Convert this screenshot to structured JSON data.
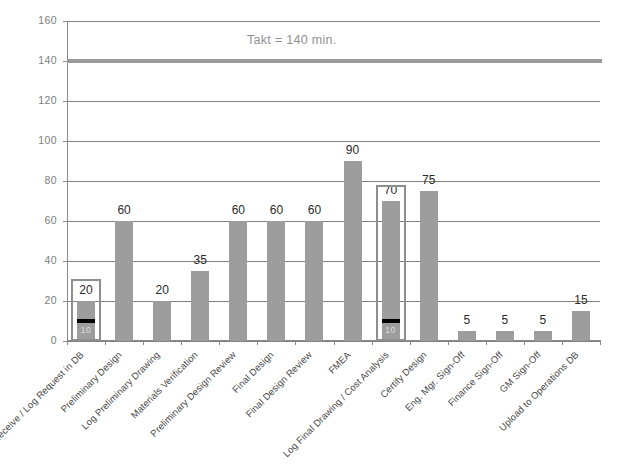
{
  "chart_data": {
    "type": "bar",
    "title": "",
    "subtitle": "",
    "xlabel": "",
    "ylabel": "",
    "ylim": [
      0,
      160
    ],
    "ytick_labels": [
      "0",
      "20",
      "40",
      "60",
      "80",
      "100",
      "120",
      "140",
      "160"
    ],
    "ytick_values": [
      0,
      20,
      40,
      60,
      80,
      100,
      120,
      140,
      160
    ],
    "grid": true,
    "legend": "none",
    "categories": [
      "Receive / Log Request in DB",
      "Preliminary Design",
      "Log Preliminary Drawing",
      "Materials Verification",
      "Preliminary Design Review",
      "Final Design",
      "Final Design Review",
      "FMEA",
      "Log Final Drawing / Cost Analysis",
      "Certify Design",
      "Eng. Mgr. Sign-Off",
      "Finance Sign-Off",
      "GM Sign-Off",
      "Upload to Operations DB"
    ],
    "values": [
      20,
      60,
      20,
      35,
      60,
      60,
      60,
      90,
      70,
      75,
      5,
      5,
      5,
      15
    ],
    "value_labels": [
      "20",
      "60",
      "20",
      "35",
      "60",
      "60",
      "60",
      "90",
      "70",
      "75",
      "5",
      "5",
      "5",
      "15"
    ],
    "annotations": [
      {
        "name": "takt-line",
        "label": "Takt = 140 min.",
        "value": 140
      },
      {
        "name": "highlight-callout-1",
        "category_index": 0,
        "box_top_value": 31,
        "marker_value": 10,
        "marker_label": "10"
      },
      {
        "name": "highlight-callout-2",
        "category_index": 8,
        "box_top_value": 78,
        "marker_value": 10,
        "marker_label": "10"
      }
    ],
    "colors": {
      "bar": "#9d9d9d",
      "grid": "#808080",
      "takt_line": "#9a9a9a",
      "takt_label": "#8f8f8f",
      "highlight_box": "#8e8e8e",
      "marker": "#000000",
      "axis": "#8a8a8a",
      "tick_label": "#7d7d7d",
      "value_label": "#2b2b2b",
      "category_label": "#4a4a4a",
      "background": "#ffffff"
    }
  }
}
